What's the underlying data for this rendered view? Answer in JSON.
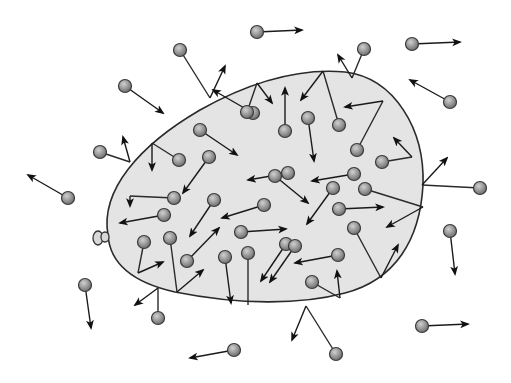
{
  "figure": {
    "title": "Gas molecules inside and outside a balloon",
    "colors": {
      "background": "#ffffff",
      "balloon_fill": "#e4e4e4",
      "balloon_stroke": "#2a2a2a",
      "molecule_fill": "#9a9a9a",
      "molecule_highlight": "#d0d0d0",
      "line": "#1a1a1a"
    }
  },
  "balloon": {
    "outline_path": "M 108 235 C 100 190, 140 145, 200 110 C 250 82, 300 68, 345 72 C 395 78, 425 130, 423 185 C 420 240, 395 280, 345 293 C 300 305, 240 305, 175 292 C 135 283, 110 265, 108 235 Z",
    "knot": {
      "cx": 101,
      "cy": 238
    }
  },
  "molecules": [
    {
      "id": "m1",
      "region": "outside",
      "x": 257,
      "y": 32,
      "path": [],
      "arrow_to": [
        302,
        30
      ]
    },
    {
      "id": "m2",
      "region": "outside",
      "x": 412,
      "y": 44,
      "path": [],
      "arrow_to": [
        460,
        42
      ]
    },
    {
      "id": "m3",
      "region": "outside",
      "x": 364,
      "y": 49,
      "path": [
        [
          352,
          78
        ]
      ],
      "arrow_to": [
        338,
        55
      ]
    },
    {
      "id": "m4",
      "region": "outside",
      "x": 180,
      "y": 50,
      "path": [
        [
          210,
          98
        ]
      ],
      "arrow_to": [
        225,
        66
      ]
    },
    {
      "id": "m5",
      "region": "outside",
      "x": 125,
      "y": 86,
      "path": [],
      "arrow_to": [
        163,
        113
      ]
    },
    {
      "id": "m6",
      "region": "outside",
      "x": 450,
      "y": 102,
      "path": [],
      "arrow_to": [
        410,
        80
      ]
    },
    {
      "id": "m7",
      "region": "outside",
      "x": 100,
      "y": 152,
      "path": [
        [
          130,
          162
        ]
      ],
      "arrow_to": [
        123,
        137
      ]
    },
    {
      "id": "m8",
      "region": "outside",
      "x": 68,
      "y": 198,
      "path": [],
      "arrow_to": [
        28,
        175
      ]
    },
    {
      "id": "m9",
      "region": "outside",
      "x": 480,
      "y": 188,
      "path": [
        [
          422,
          185
        ]
      ],
      "arrow_to": [
        447,
        158
      ]
    },
    {
      "id": "m10",
      "region": "outside",
      "x": 450,
      "y": 231,
      "path": [],
      "arrow_to": [
        455,
        274
      ]
    },
    {
      "id": "m11",
      "region": "outside",
      "x": 85,
      "y": 285,
      "path": [],
      "arrow_to": [
        91,
        328
      ]
    },
    {
      "id": "m12",
      "region": "outside",
      "x": 158,
      "y": 318,
      "path": [
        [
          158,
          288
        ]
      ],
      "arrow_to": [
        135,
        305
      ]
    },
    {
      "id": "m13",
      "region": "outside",
      "x": 422,
      "y": 326,
      "path": [],
      "arrow_to": [
        468,
        324
      ]
    },
    {
      "id": "m14",
      "region": "outside",
      "x": 336,
      "y": 354,
      "path": [
        [
          306,
          306
        ]
      ],
      "arrow_to": [
        292,
        340
      ]
    },
    {
      "id": "m15",
      "region": "outside",
      "x": 234,
      "y": 350,
      "path": [],
      "arrow_to": [
        190,
        358
      ]
    },
    {
      "id": "m16",
      "region": "inside",
      "x": 179,
      "y": 160,
      "path": [
        [
          152,
          143
        ]
      ],
      "arrow_to": [
        152,
        170
      ]
    },
    {
      "id": "m17",
      "region": "inside",
      "x": 253,
      "y": 113,
      "path": [],
      "arrow_to": [
        213,
        90
      ]
    },
    {
      "id": "m18",
      "region": "inside",
      "x": 200,
      "y": 130,
      "path": [],
      "arrow_to": [
        237,
        155
      ]
    },
    {
      "id": "m19",
      "region": "inside",
      "x": 209,
      "y": 157,
      "path": [],
      "arrow_to": [
        183,
        193
      ]
    },
    {
      "id": "m20",
      "region": "inside",
      "x": 247,
      "y": 112,
      "path": [
        [
          257,
          83
        ]
      ],
      "arrow_to": [
        272,
        103
      ]
    },
    {
      "id": "m21",
      "region": "inside",
      "x": 285,
      "y": 131,
      "path": [],
      "arrow_to": [
        285,
        88
      ]
    },
    {
      "id": "m22",
      "region": "inside",
      "x": 308,
      "y": 118,
      "path": [],
      "arrow_to": [
        314,
        161
      ]
    },
    {
      "id": "m23",
      "region": "inside",
      "x": 339,
      "y": 125,
      "path": [
        [
          323,
          71
        ]
      ],
      "arrow_to": [
        301,
        100
      ]
    },
    {
      "id": "m24",
      "region": "inside",
      "x": 357,
      "y": 150,
      "path": [
        [
          383,
          101
        ]
      ],
      "arrow_to": [
        345,
        107
      ]
    },
    {
      "id": "m25",
      "region": "inside",
      "x": 382,
      "y": 162,
      "path": [
        [
          412,
          157
        ]
      ],
      "arrow_to": [
        394,
        138
      ]
    },
    {
      "id": "m26",
      "region": "inside",
      "x": 288,
      "y": 173,
      "path": [],
      "arrow_to": [
        248,
        180
      ]
    },
    {
      "id": "m27",
      "region": "inside",
      "x": 354,
      "y": 174,
      "path": [],
      "arrow_to": [
        312,
        181
      ]
    },
    {
      "id": "m28",
      "region": "inside",
      "x": 275,
      "y": 176,
      "path": [],
      "arrow_to": [
        308,
        203
      ]
    },
    {
      "id": "m29",
      "region": "inside",
      "x": 333,
      "y": 188,
      "path": [],
      "arrow_to": [
        307,
        224
      ]
    },
    {
      "id": "m30",
      "region": "inside",
      "x": 365,
      "y": 189,
      "path": [
        [
          423,
          207
        ]
      ],
      "arrow_to": [
        387,
        227
      ]
    },
    {
      "id": "m31",
      "region": "inside",
      "x": 174,
      "y": 198,
      "path": [
        [
          130,
          196
        ]
      ],
      "arrow_to": [
        130,
        206
      ]
    },
    {
      "id": "m32",
      "region": "inside",
      "x": 164,
      "y": 215,
      "path": [],
      "arrow_to": [
        120,
        223
      ]
    },
    {
      "id": "m33",
      "region": "inside",
      "x": 214,
      "y": 200,
      "path": [],
      "arrow_to": [
        190,
        236
      ]
    },
    {
      "id": "m34",
      "region": "inside",
      "x": 339,
      "y": 209,
      "path": [],
      "arrow_to": [
        383,
        207
      ]
    },
    {
      "id": "m35",
      "region": "inside",
      "x": 264,
      "y": 205,
      "path": [],
      "arrow_to": [
        222,
        218
      ]
    },
    {
      "id": "m36",
      "region": "inside",
      "x": 144,
      "y": 242,
      "path": [
        [
          138,
          273
        ]
      ],
      "arrow_to": [
        163,
        262
      ]
    },
    {
      "id": "m37",
      "region": "inside",
      "x": 170,
      "y": 238,
      "path": [
        [
          177,
          292
        ]
      ],
      "arrow_to": [
        203,
        270
      ]
    },
    {
      "id": "m38",
      "region": "inside",
      "x": 187,
      "y": 261,
      "path": [],
      "arrow_to": [
        219,
        228
      ]
    },
    {
      "id": "m39",
      "region": "inside",
      "x": 225,
      "y": 257,
      "path": [],
      "arrow_to": [
        231,
        303
      ]
    },
    {
      "id": "m40",
      "region": "inside",
      "x": 248,
      "y": 253,
      "path": [
        [
          248,
          305
        ]
      ],
      "arrow_to": [
        248,
        305
      ]
    },
    {
      "id": "m41",
      "region": "inside",
      "x": 241,
      "y": 232,
      "path": [],
      "arrow_to": [
        286,
        229
      ]
    },
    {
      "id": "m42",
      "region": "inside",
      "x": 286,
      "y": 244,
      "path": [],
      "arrow_to": [
        261,
        281
      ]
    },
    {
      "id": "m43",
      "region": "inside",
      "x": 354,
      "y": 228,
      "path": [
        [
          381,
          278
        ]
      ],
      "arrow_to": [
        398,
        245
      ]
    },
    {
      "id": "m44",
      "region": "inside",
      "x": 338,
      "y": 255,
      "path": [],
      "arrow_to": [
        295,
        263
      ]
    },
    {
      "id": "m45",
      "region": "inside",
      "x": 312,
      "y": 282,
      "path": [
        [
          340,
          298
        ]
      ],
      "arrow_to": [
        337,
        271
      ]
    },
    {
      "id": "m46",
      "region": "inside",
      "x": 295,
      "y": 246,
      "path": [],
      "arrow_to": [
        270,
        282
      ]
    }
  ]
}
